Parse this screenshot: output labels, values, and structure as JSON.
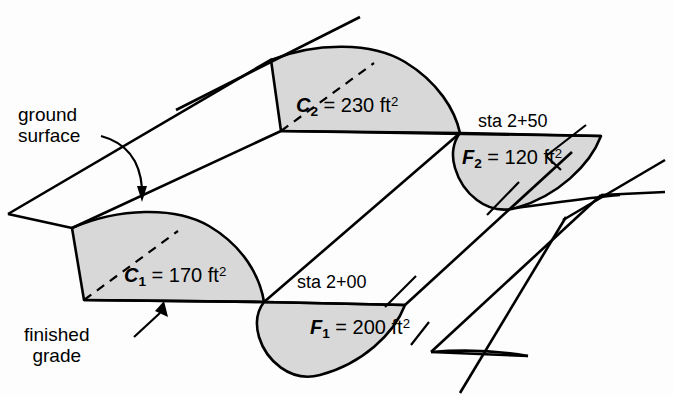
{
  "diagram": {
    "type": "engineering-earthwork-diagram",
    "colors": {
      "line": "#000000",
      "fill_gray": "#d8d8d8",
      "background": "#fdfdfd"
    },
    "annotations": [
      {
        "id": "ground-surface",
        "line1": "ground",
        "line2": "surface"
      },
      {
        "id": "finished-grade",
        "line1": "finished",
        "line2": "grade"
      }
    ],
    "stations": [
      {
        "id": "sta-2-00",
        "label": "sta 2+00"
      },
      {
        "id": "sta-2-50",
        "label": "sta 2+50"
      }
    ],
    "areas": [
      {
        "id": "c1",
        "symbol": "C",
        "subscript": "1",
        "equals": "=",
        "value": "170",
        "unit": "ft",
        "exponent": "2",
        "kind": "cut"
      },
      {
        "id": "c2",
        "symbol": "C",
        "subscript": "2",
        "equals": "=",
        "value": "230",
        "unit": "ft",
        "exponent": "2",
        "kind": "cut"
      },
      {
        "id": "f1",
        "symbol": "F",
        "subscript": "1",
        "equals": "=",
        "value": "200",
        "unit": "ft",
        "exponent": "2",
        "kind": "fill"
      },
      {
        "id": "f2",
        "symbol": "F",
        "subscript": "2",
        "equals": "=",
        "value": "120",
        "unit": "ft",
        "exponent": "2",
        "kind": "fill"
      }
    ]
  }
}
